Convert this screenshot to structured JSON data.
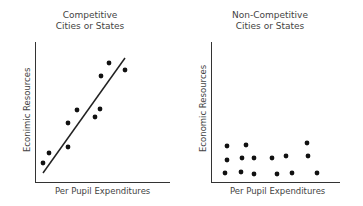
{
  "chart_data": [
    {
      "type": "scatter",
      "title": "Competitive Cities or States",
      "title_lines": [
        "Competitive",
        "Cities or States"
      ],
      "xlabel": "Per Pupil Expenditures",
      "ylabel": "Econimic Resources",
      "grid": false,
      "trend_line": {
        "from": [
          43,
          173
        ],
        "to": [
          125,
          58
        ]
      },
      "points": [
        [
          43,
          163
        ],
        [
          49,
          153
        ],
        [
          68,
          147
        ],
        [
          68,
          123
        ],
        [
          77,
          110
        ],
        [
          95,
          117
        ],
        [
          100,
          109
        ],
        [
          101,
          76
        ],
        [
          109,
          63
        ],
        [
          125,
          70
        ]
      ]
    },
    {
      "type": "scatter",
      "title": "Non-Competitive Cities or States",
      "title_lines": [
        "Non-Competitive",
        "Cities or States"
      ],
      "xlabel": "Per Pupil Expenditures",
      "ylabel": "Economic Resources",
      "grid": false,
      "points": [
        [
          227,
          146
        ],
        [
          246,
          145
        ],
        [
          227,
          160
        ],
        [
          242,
          158
        ],
        [
          254,
          158
        ],
        [
          272,
          158
        ],
        [
          286,
          156
        ],
        [
          307,
          143
        ],
        [
          308,
          156
        ],
        [
          225,
          173
        ],
        [
          241,
          172
        ],
        [
          254,
          174
        ],
        [
          277,
          174
        ],
        [
          292,
          173
        ],
        [
          317,
          173
        ]
      ]
    }
  ],
  "charts": {
    "left": {
      "title1": "Competitive",
      "title2": "Cities or States",
      "xlabel": "Per Pupil Expenditures",
      "ylabel": "Econimic Resources"
    },
    "right": {
      "title1": "Non-Competitive",
      "title2": "Cities or States",
      "xlabel": "Per Pupil Expenditures",
      "ylabel": "Economic Resources"
    }
  }
}
